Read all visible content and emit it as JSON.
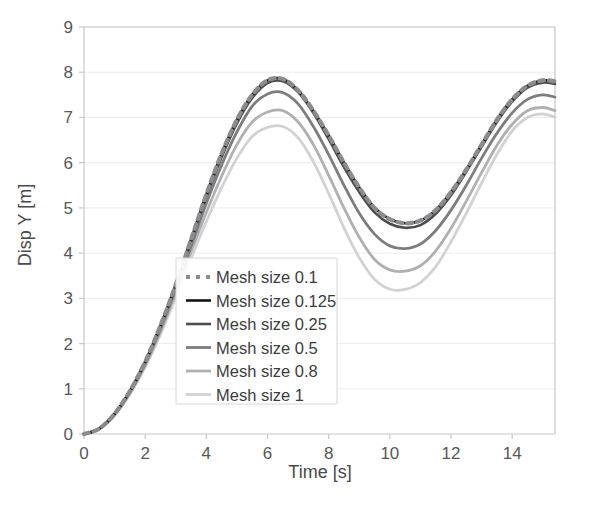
{
  "chart_data": {
    "type": "line",
    "title": "",
    "xlabel": "Time  [s]",
    "ylabel": "Disp Y [m]",
    "xlim": [
      0,
      15.4
    ],
    "ylim": [
      0,
      9
    ],
    "xticks": [
      0,
      2,
      4,
      6,
      8,
      10,
      12,
      14
    ],
    "xtick_labels": [
      "0",
      "2",
      "4",
      "6",
      "8",
      "10",
      "12",
      "14"
    ],
    "yticks": [
      0,
      1,
      2,
      3,
      4,
      5,
      6,
      7,
      8,
      9
    ],
    "ytick_labels": [
      "0",
      "1",
      "2",
      "3",
      "4",
      "5",
      "6",
      "7",
      "8",
      "9"
    ],
    "grid": "horizontal",
    "legend_position": "center-left-inside",
    "x": [
      0,
      0.5,
      1,
      1.5,
      2,
      2.5,
      3,
      3.5,
      4,
      4.5,
      5,
      5.5,
      6,
      6.5,
      7,
      7.5,
      8,
      8.5,
      9,
      9.5,
      10,
      10.5,
      11,
      11.5,
      12,
      12.5,
      13,
      13.5,
      14,
      14.5,
      15,
      15.4
    ],
    "series": [
      {
        "name": "Mesh size 0.1",
        "color": "#8c8c8e",
        "style": "dotted",
        "width": 4.2,
        "values": [
          0.0,
          0.12,
          0.45,
          0.95,
          1.6,
          2.4,
          3.3,
          4.3,
          5.3,
          6.2,
          6.95,
          7.5,
          7.82,
          7.85,
          7.6,
          7.15,
          6.6,
          6.0,
          5.45,
          5.0,
          4.75,
          4.66,
          4.72,
          4.95,
          5.35,
          5.85,
          6.4,
          6.95,
          7.4,
          7.7,
          7.82,
          7.8
        ]
      },
      {
        "name": "Mesh size 0.125",
        "color": "#121212",
        "style": "solid",
        "width": 2.6,
        "values": [
          0.0,
          0.12,
          0.45,
          0.95,
          1.6,
          2.4,
          3.3,
          4.3,
          5.3,
          6.2,
          6.95,
          7.5,
          7.82,
          7.85,
          7.6,
          7.15,
          6.6,
          6.0,
          5.45,
          5.0,
          4.75,
          4.66,
          4.72,
          4.95,
          5.35,
          5.85,
          6.4,
          6.95,
          7.4,
          7.7,
          7.82,
          7.8
        ]
      },
      {
        "name": "Mesh size 0.25",
        "color": "#4d4d4f",
        "style": "solid",
        "width": 2.6,
        "values": [
          0.0,
          0.12,
          0.44,
          0.94,
          1.58,
          2.37,
          3.27,
          4.25,
          5.24,
          6.12,
          6.87,
          7.43,
          7.76,
          7.8,
          7.56,
          7.1,
          6.52,
          5.9,
          5.35,
          4.9,
          4.65,
          4.56,
          4.62,
          4.87,
          5.28,
          5.8,
          6.35,
          6.9,
          7.35,
          7.66,
          7.77,
          7.74
        ]
      },
      {
        "name": "Mesh size 0.5",
        "color": "#7d7d7f",
        "style": "solid",
        "width": 2.8,
        "values": [
          0.0,
          0.12,
          0.43,
          0.92,
          1.55,
          2.32,
          3.2,
          4.15,
          5.1,
          5.95,
          6.68,
          7.25,
          7.52,
          7.55,
          7.3,
          6.8,
          6.18,
          5.5,
          4.88,
          4.42,
          4.16,
          4.1,
          4.2,
          4.5,
          4.95,
          5.5,
          6.1,
          6.65,
          7.1,
          7.4,
          7.5,
          7.45
        ]
      },
      {
        "name": "Mesh size 0.8",
        "color": "#b0b0b2",
        "style": "solid",
        "width": 2.8,
        "values": [
          0.0,
          0.11,
          0.42,
          0.9,
          1.52,
          2.27,
          3.12,
          4.03,
          4.9,
          5.7,
          6.4,
          6.9,
          7.12,
          7.15,
          6.9,
          6.4,
          5.72,
          5.0,
          4.35,
          3.86,
          3.63,
          3.6,
          3.72,
          4.05,
          4.55,
          5.15,
          5.78,
          6.38,
          6.85,
          7.15,
          7.22,
          7.15
        ]
      },
      {
        "name": "Mesh size 1",
        "color": "#d2d2d4",
        "style": "solid",
        "width": 2.8,
        "values": [
          0.0,
          0.11,
          0.41,
          0.88,
          1.48,
          2.2,
          3.02,
          3.88,
          4.7,
          5.45,
          6.1,
          6.58,
          6.78,
          6.8,
          6.55,
          6.02,
          5.32,
          4.56,
          3.9,
          3.42,
          3.2,
          3.2,
          3.35,
          3.7,
          4.25,
          4.88,
          5.55,
          6.18,
          6.7,
          7.0,
          7.08,
          7.0
        ]
      }
    ]
  },
  "legend": {
    "entries": [
      {
        "label": "Mesh size 0.1"
      },
      {
        "label": "Mesh size 0.125"
      },
      {
        "label": "Mesh size 0.25"
      },
      {
        "label": "Mesh size 0.5"
      },
      {
        "label": "Mesh size 0.8"
      },
      {
        "label": "Mesh size 1"
      }
    ]
  }
}
